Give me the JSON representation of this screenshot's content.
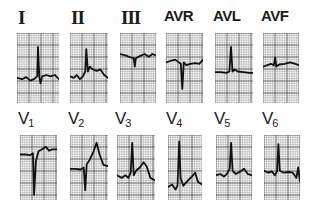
{
  "figure": {
    "type": "12-lead ECG",
    "rows": [
      {
        "name": "limb-leads",
        "leads": [
          {
            "id": "I",
            "label": "I",
            "style": "roman",
            "x": 17,
            "y": 33,
            "w": 42,
            "h": 70,
            "baseline": 0.66,
            "trace": [
              [
                0,
                0.64
              ],
              [
                0.12,
                0.66
              ],
              [
                0.22,
                0.63
              ],
              [
                0.32,
                0.68
              ],
              [
                0.4,
                0.66
              ],
              [
                0.48,
                0.62
              ],
              [
                0.5,
                0.2
              ],
              [
                0.53,
                0.62
              ],
              [
                0.56,
                0.72
              ],
              [
                0.6,
                0.62
              ],
              [
                0.7,
                0.6
              ],
              [
                0.8,
                0.62
              ],
              [
                0.9,
                0.6
              ],
              [
                1,
                0.66
              ]
            ]
          },
          {
            "id": "II",
            "label": "II",
            "style": "roman",
            "x": 70,
            "y": 33,
            "w": 38,
            "h": 70,
            "baseline": 0.63,
            "trace": [
              [
                0,
                0.62
              ],
              [
                0.1,
                0.64
              ],
              [
                0.18,
                0.6
              ],
              [
                0.26,
                0.66
              ],
              [
                0.34,
                0.62
              ],
              [
                0.4,
                0.55
              ],
              [
                0.43,
                0.23
              ],
              [
                0.47,
                0.55
              ],
              [
                0.52,
                0.48
              ],
              [
                0.6,
                0.52
              ],
              [
                0.7,
                0.54
              ],
              [
                0.8,
                0.52
              ],
              [
                0.9,
                0.6
              ],
              [
                1,
                0.64
              ]
            ]
          },
          {
            "id": "III",
            "label": "III",
            "style": "roman",
            "x": 120,
            "y": 33,
            "w": 36,
            "h": 70,
            "baseline": 0.33,
            "trace": [
              [
                0,
                0.3
              ],
              [
                0.15,
                0.32
              ],
              [
                0.3,
                0.35
              ],
              [
                0.38,
                0.36
              ],
              [
                0.41,
                0.48
              ],
              [
                0.44,
                0.36
              ],
              [
                0.55,
                0.33
              ],
              [
                0.68,
                0.3
              ],
              [
                0.8,
                0.34
              ],
              [
                0.9,
                0.3
              ],
              [
                1,
                0.32
              ]
            ]
          },
          {
            "id": "AVR",
            "label": "AVR",
            "style": "aug",
            "x": 166,
            "y": 33,
            "w": 37,
            "h": 70,
            "baseline": 0.42,
            "trace": [
              [
                0,
                0.42
              ],
              [
                0.12,
                0.4
              ],
              [
                0.25,
                0.38
              ],
              [
                0.35,
                0.42
              ],
              [
                0.4,
                0.44
              ],
              [
                0.44,
                0.8
              ],
              [
                0.48,
                0.42
              ],
              [
                0.55,
                0.46
              ],
              [
                0.65,
                0.44
              ],
              [
                0.8,
                0.43
              ],
              [
                0.9,
                0.44
              ],
              [
                1,
                0.38
              ]
            ]
          },
          {
            "id": "AVL",
            "label": "AVL",
            "style": "aug",
            "x": 215,
            "y": 33,
            "w": 38,
            "h": 70,
            "baseline": 0.56,
            "trace": [
              [
                0,
                0.56
              ],
              [
                0.15,
                0.56
              ],
              [
                0.3,
                0.57
              ],
              [
                0.38,
                0.55
              ],
              [
                0.42,
                0.2
              ],
              [
                0.46,
                0.55
              ],
              [
                0.52,
                0.52
              ],
              [
                0.6,
                0.55
              ],
              [
                0.75,
                0.56
              ],
              [
                0.9,
                0.57
              ],
              [
                1,
                0.57
              ]
            ]
          },
          {
            "id": "AVF",
            "label": "AVF",
            "style": "aug",
            "x": 263,
            "y": 33,
            "w": 36,
            "h": 70,
            "baseline": 0.47,
            "trace": [
              [
                0,
                0.48
              ],
              [
                0.12,
                0.46
              ],
              [
                0.22,
                0.44
              ],
              [
                0.3,
                0.46
              ],
              [
                0.34,
                0.35
              ],
              [
                0.37,
                0.48
              ],
              [
                0.45,
                0.45
              ],
              [
                0.6,
                0.44
              ],
              [
                0.75,
                0.42
              ],
              [
                0.9,
                0.44
              ],
              [
                1,
                0.46
              ]
            ]
          }
        ]
      },
      {
        "name": "precordial-leads",
        "leads": [
          {
            "id": "V1",
            "label": "V",
            "sub": "1",
            "style": "prec",
            "x": 20,
            "y": 135,
            "w": 37,
            "h": 65,
            "baseline": 0.3,
            "trace": [
              [
                0,
                0.3
              ],
              [
                0.15,
                0.3
              ],
              [
                0.28,
                0.31
              ],
              [
                0.35,
                0.28
              ],
              [
                0.38,
                0.92
              ],
              [
                0.43,
                0.4
              ],
              [
                0.5,
                0.25
              ],
              [
                0.6,
                0.22
              ],
              [
                0.7,
                0.18
              ],
              [
                0.78,
                0.24
              ],
              [
                0.88,
                0.22
              ],
              [
                1,
                0.22
              ]
            ]
          },
          {
            "id": "V2",
            "label": "V",
            "sub": "2",
            "style": "prec",
            "x": 70,
            "y": 135,
            "w": 38,
            "h": 65,
            "baseline": 0.52,
            "trace": [
              [
                0,
                0.52
              ],
              [
                0.15,
                0.52
              ],
              [
                0.28,
                0.53
              ],
              [
                0.36,
                0.5
              ],
              [
                0.4,
                0.85
              ],
              [
                0.44,
                0.45
              ],
              [
                0.52,
                0.38
              ],
              [
                0.62,
                0.25
              ],
              [
                0.7,
                0.12
              ],
              [
                0.78,
                0.3
              ],
              [
                0.88,
                0.46
              ],
              [
                1,
                0.48
              ]
            ]
          },
          {
            "id": "V3",
            "label": "V",
            "sub": "3",
            "style": "prec",
            "x": 117,
            "y": 135,
            "w": 38,
            "h": 65,
            "baseline": 0.64,
            "trace": [
              [
                0,
                0.62
              ],
              [
                0.12,
                0.66
              ],
              [
                0.22,
                0.62
              ],
              [
                0.3,
                0.66
              ],
              [
                0.36,
                0.58
              ],
              [
                0.4,
                0.12
              ],
              [
                0.44,
                0.62
              ],
              [
                0.5,
                0.55
              ],
              [
                0.6,
                0.5
              ],
              [
                0.7,
                0.42
              ],
              [
                0.78,
                0.48
              ],
              [
                0.88,
                0.66
              ],
              [
                1,
                0.7
              ]
            ]
          },
          {
            "id": "V4",
            "label": "V",
            "sub": "4",
            "style": "prec",
            "x": 168,
            "y": 135,
            "w": 34,
            "h": 65,
            "baseline": 0.8,
            "trace": [
              [
                0,
                0.8
              ],
              [
                0.12,
                0.76
              ],
              [
                0.22,
                0.84
              ],
              [
                0.28,
                0.78
              ],
              [
                0.33,
                0.1
              ],
              [
                0.37,
                0.66
              ],
              [
                0.45,
                0.78
              ],
              [
                0.55,
                0.72
              ],
              [
                0.7,
                0.64
              ],
              [
                0.8,
                0.58
              ],
              [
                0.88,
                0.72
              ],
              [
                1,
                0.76
              ]
            ]
          },
          {
            "id": "V5",
            "label": "V",
            "sub": "5",
            "style": "prec",
            "x": 216,
            "y": 135,
            "w": 36,
            "h": 65,
            "baseline": 0.62,
            "trace": [
              [
                0,
                0.62
              ],
              [
                0.12,
                0.6
              ],
              [
                0.22,
                0.64
              ],
              [
                0.3,
                0.6
              ],
              [
                0.38,
                0.52
              ],
              [
                0.42,
                0.12
              ],
              [
                0.46,
                0.55
              ],
              [
                0.55,
                0.6
              ],
              [
                0.68,
                0.56
              ],
              [
                0.78,
                0.52
              ],
              [
                0.88,
                0.6
              ],
              [
                1,
                0.62
              ]
            ]
          },
          {
            "id": "V6",
            "label": "V",
            "sub": "6",
            "style": "prec",
            "x": 264,
            "y": 135,
            "w": 36,
            "h": 65,
            "baseline": 0.58,
            "trace": [
              [
                0,
                0.55
              ],
              [
                0.12,
                0.58
              ],
              [
                0.22,
                0.56
              ],
              [
                0.3,
                0.62
              ],
              [
                0.36,
                0.56
              ],
              [
                0.4,
                0.14
              ],
              [
                0.44,
                0.55
              ],
              [
                0.55,
                0.58
              ],
              [
                0.68,
                0.57
              ],
              [
                0.8,
                0.58
              ],
              [
                0.9,
                0.66
              ],
              [
                0.95,
                0.5
              ],
              [
                1,
                0.72
              ]
            ]
          }
        ]
      }
    ]
  },
  "colors": {
    "background": "#ffffff",
    "grid_fine": "#9a9a9a",
    "grid_major": "#555555",
    "paper": "#f4f4f4",
    "trace": "#111111",
    "label": "#1a1a1a"
  }
}
